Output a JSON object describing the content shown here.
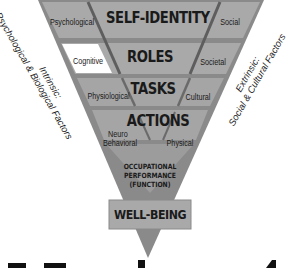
{
  "diagram": {
    "levels": [
      {
        "title": "SELF-IDENTITY",
        "left": "Psychological",
        "right": "Social"
      },
      {
        "title": "ROLES",
        "left": "Cognitive",
        "right": "Societal"
      },
      {
        "title": "TASKS",
        "left": "Physiological",
        "right": "Cultural"
      },
      {
        "title": "ACTIONS",
        "left_line1": "Neuro",
        "left_line2": "Behavioral",
        "right": "Physical"
      }
    ],
    "occupational_performance": {
      "line1": "OCCUPATIONAL",
      "line2": "PERFORMANCE",
      "line3": "(FUNCTION)"
    },
    "outcome": "WELL-BEING",
    "left_axis": {
      "line1": "Intrinsic:",
      "line2": "Psychological & Biological Factors"
    },
    "right_axis": {
      "line1": "Extrinsic:",
      "line2": "Social & Cultural Factors"
    }
  },
  "colors": {
    "band_fill": "#a8a8a8",
    "band_dark": "#7a7a7a",
    "divider": "#5e5e5e",
    "cognitive_cell": "#ffffff",
    "text": "#1a1a1a"
  }
}
